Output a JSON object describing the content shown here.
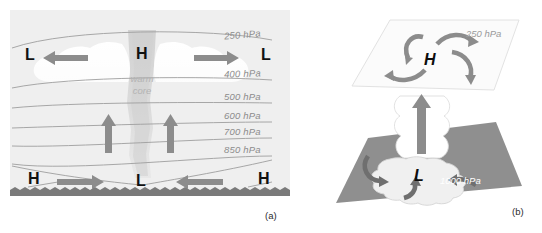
{
  "figure": {
    "panels": [
      {
        "id": "a",
        "caption": "(a)",
        "description": "Vertical cross-section of a warm-core tropical cyclone showing pressure surfaces, inflow at the surface, ascent in the core, and outflow aloft.",
        "pressure_levels": [
          {
            "label": "250 hPa",
            "value": 250
          },
          {
            "label": "400 hPa",
            "value": 400
          },
          {
            "label": "500 hPa",
            "value": 500
          },
          {
            "label": "600 hPa",
            "value": 600
          },
          {
            "label": "700 hPa",
            "value": 700
          },
          {
            "label": "850 hPa",
            "value": 850
          }
        ],
        "core_label": "warm\ncore",
        "core_label_line1": "warm",
        "core_label_line2": "core",
        "upper_letters": [
          {
            "letter": "L",
            "position": "upper-left"
          },
          {
            "letter": "H",
            "position": "upper-center"
          },
          {
            "letter": "L",
            "position": "upper-right"
          }
        ],
        "surface_letters": [
          {
            "letter": "H",
            "position": "surface-left"
          },
          {
            "letter": "L",
            "position": "surface-center"
          },
          {
            "letter": "H",
            "position": "surface-right"
          }
        ],
        "arrows": [
          {
            "name": "upper-outflow-left",
            "direction": "left"
          },
          {
            "name": "upper-outflow-right",
            "direction": "right"
          },
          {
            "name": "core-ascent-left",
            "direction": "up"
          },
          {
            "name": "core-ascent-right",
            "direction": "up"
          },
          {
            "name": "surface-inflow-left",
            "direction": "right"
          },
          {
            "name": "surface-inflow-right",
            "direction": "left"
          }
        ]
      },
      {
        "id": "b",
        "caption": "(b)",
        "description": "Three-dimensional view: divergent anticyclonic outflow on the 250 hPa surface above convergent cyclonic inflow at the 1000 hPa surface, linked by a cloud column with ascent.",
        "upper_plane_label": "250 hPa",
        "lower_plane_label": "1000 hPa",
        "upper_letter": "H",
        "lower_letter": "L",
        "arrows": [
          {
            "name": "outflow-arrow-nw",
            "type": "curved"
          },
          {
            "name": "outflow-arrow-ne",
            "type": "curved"
          },
          {
            "name": "outflow-arrow-sw",
            "type": "curved"
          },
          {
            "name": "outflow-arrow-se",
            "type": "curved"
          },
          {
            "name": "ascent-arrow",
            "type": "straight-up"
          },
          {
            "name": "inflow-arrow-w",
            "type": "curved"
          },
          {
            "name": "inflow-arrow-s",
            "type": "curved"
          },
          {
            "name": "inflow-arrow-e",
            "type": "curved"
          }
        ]
      }
    ]
  },
  "colors": {
    "panel_background": "#efefef",
    "arrow_gray": "#8c8c8c",
    "isobar_gray": "#9e9e9e",
    "surface_band": "#7a7a7a",
    "lower_plane": "#8f8f8f",
    "upper_plane": "#fbfbfb",
    "cloud_white": "#ffffff",
    "core_gray": "#d8d8d8",
    "label_gray": "#8c8c8c",
    "letter_black": "#111111"
  }
}
